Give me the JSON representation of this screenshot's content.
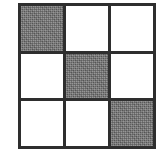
{
  "figure": {
    "type": "grid-pattern",
    "rows": 3,
    "columns": 3,
    "colors": {
      "background": "#ffffff",
      "gridline": "#2e2e2e",
      "shaded_fill": "#6e6e6e",
      "blank_fill": "#ffffff"
    },
    "gridline_width_px": 3,
    "shaded_pattern": "dithered-halftone",
    "cells": [
      {
        "row": 1,
        "column": 1,
        "state": "shaded",
        "label": ""
      },
      {
        "row": 1,
        "column": 2,
        "state": "blank",
        "label": ""
      },
      {
        "row": 1,
        "column": 3,
        "state": "blank",
        "label": ""
      },
      {
        "row": 2,
        "column": 1,
        "state": "blank",
        "label": ""
      },
      {
        "row": 2,
        "column": 2,
        "state": "shaded",
        "label": ""
      },
      {
        "row": 2,
        "column": 3,
        "state": "blank",
        "label": ""
      },
      {
        "row": 3,
        "column": 1,
        "state": "blank",
        "label": ""
      },
      {
        "row": 3,
        "column": 2,
        "state": "blank",
        "label": ""
      },
      {
        "row": 3,
        "column": 3,
        "state": "shaded",
        "label": ""
      }
    ],
    "shaded_count": 3,
    "blank_count": 6,
    "pattern_description": "main diagonal shaded"
  }
}
